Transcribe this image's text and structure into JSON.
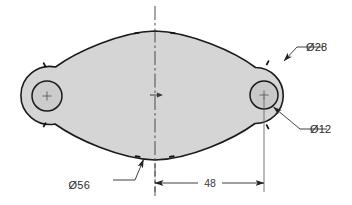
{
  "drawing": {
    "title": "Oval plate with two holes - dimensioned engineering sketch",
    "background_color": "#ffffff",
    "part": {
      "name": "two-lobe-plate",
      "fill_color": "#d5d5d5",
      "outline_color": "#1a1a1a",
      "outline_width": 1.6
    },
    "geometry": {
      "left_lobe_center": {
        "x": 47,
        "y": 96
      },
      "right_lobe_center": {
        "x": 264,
        "y": 95
      },
      "left_lobe_outer_radius": 29,
      "right_lobe_outer_radius": 28,
      "left_hole_radius": 15,
      "right_hole_radius": 14,
      "top_vertex": {
        "x": 155,
        "y": 31
      },
      "bottom_vertex": {
        "x": 155,
        "y": 160
      }
    },
    "centerlines": {
      "color": "#3a3a3a",
      "vertical_x": 155,
      "vertical_y1": 6,
      "vertical_y2": 196,
      "center_mark": {
        "x": 155,
        "y": 95
      }
    },
    "dimensions": [
      {
        "id": "outer-arc-diameter",
        "label": "Ø28",
        "type": "leader",
        "refers_to": "outer lobe arc",
        "text_x": 306,
        "text_y": 51,
        "leader_points": "283,62 297,47 323,47",
        "arrow_at": {
          "x": 283,
          "y": 62
        }
      },
      {
        "id": "hole-diameter",
        "label": "Ø12",
        "type": "leader",
        "refers_to": "right hole circle",
        "text_x": 310,
        "text_y": 133,
        "leader_points": "272,106 300,129 327,129",
        "arrow_at": {
          "x": 272,
          "y": 106
        }
      },
      {
        "id": "lobe-diameter",
        "label": "Ø56",
        "type": "leader",
        "refers_to": "lower left edge of plate",
        "text_x": 90,
        "text_y": 189,
        "leader_points": "144,158 135,180 113,180",
        "arrow_at": {
          "x": 144,
          "y": 158
        }
      },
      {
        "id": "center-distance",
        "label": "48",
        "type": "linear",
        "refers_to": "centerline to right hole center",
        "value": 48,
        "text_x": 210,
        "text_y": 186,
        "line_y": 183,
        "line_x1": 155,
        "line_x2": 264,
        "extension_left": {
          "x": 155,
          "y1": 160,
          "y2": 192
        },
        "extension_right": {
          "x": 264,
          "y1": 95,
          "y2": 192
        }
      }
    ],
    "spline_ticks": {
      "color": "#1a1a1a",
      "points": [
        {
          "x": 137,
          "y": 34
        },
        {
          "x": 173,
          "y": 34
        },
        {
          "x": 268,
          "y": 64
        },
        {
          "x": 268,
          "y": 127
        },
        {
          "x": 172,
          "y": 157
        },
        {
          "x": 138,
          "y": 157
        },
        {
          "x": 45,
          "y": 125
        },
        {
          "x": 45,
          "y": 67
        }
      ]
    }
  }
}
